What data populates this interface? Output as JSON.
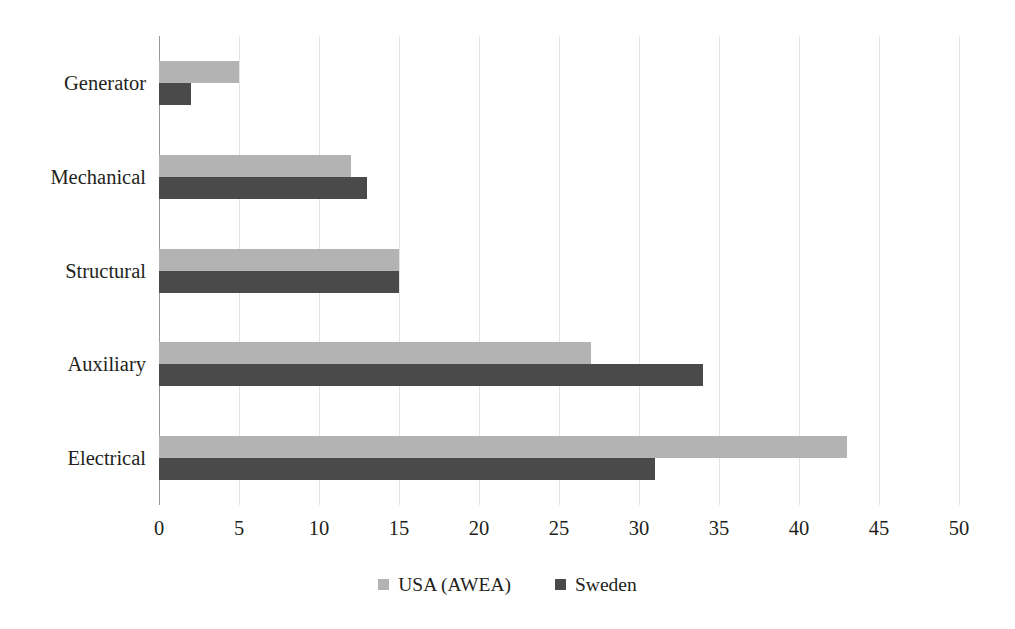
{
  "chart_data": {
    "type": "bar",
    "orientation": "horizontal",
    "title": "",
    "xlabel": "",
    "ylabel": "",
    "categories": [
      "Generator",
      "Mechanical",
      "Structural",
      "Auxiliary",
      "Electrical"
    ],
    "series": [
      {
        "name": "USA (AWEA)",
        "color": "#b3b3b3",
        "values": [
          5,
          12,
          15,
          27,
          43
        ]
      },
      {
        "name": "Sweden",
        "color": "#4a4a4a",
        "values": [
          2,
          13,
          15,
          34,
          31
        ]
      }
    ],
    "xlim": [
      0,
      50
    ],
    "xticks": [
      0,
      5,
      10,
      15,
      20,
      25,
      30,
      35,
      40,
      45,
      50
    ],
    "xtick_labels": [
      "0",
      "5",
      "10",
      "15",
      "20",
      "25",
      "30",
      "35",
      "40",
      "45",
      "50"
    ],
    "grid": {
      "vertical": true,
      "horizontal": false,
      "color": "#e4e4e4"
    },
    "axis_line_color": "#9a9a9a",
    "legend": {
      "position": "bottom-center",
      "entries": [
        {
          "label": "USA (AWEA)",
          "color": "#b3b3b3"
        },
        {
          "label": "Sweden",
          "color": "#4a4a4a"
        }
      ]
    }
  }
}
